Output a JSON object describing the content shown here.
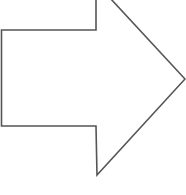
{
  "diagram": {
    "shape": "right-arrow",
    "stroke_color": "#555555",
    "fill_color": "#ffffff",
    "points": "1.5,30 96,30 96,-2 110,-2 185,79 97,175 96,126 1.5,126"
  }
}
